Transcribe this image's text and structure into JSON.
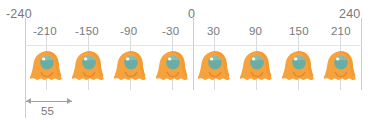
{
  "diagram": {
    "type": "linear-array-layout",
    "title_visible": false,
    "axis": {
      "outer_labels": [
        {
          "text": "-240",
          "value": -240
        },
        {
          "text": "0",
          "value": 0
        },
        {
          "text": "240",
          "value": 240
        }
      ],
      "tick_labels": [
        {
          "text": "-210",
          "value": -210
        },
        {
          "text": "-150",
          "value": -150
        },
        {
          "text": "-90",
          "value": -90
        },
        {
          "text": "-30",
          "value": -30
        },
        {
          "text": "30",
          "value": 30
        },
        {
          "text": "90",
          "value": 90
        },
        {
          "text": "150",
          "value": 150
        },
        {
          "text": "210",
          "value": 210
        }
      ]
    },
    "items": [
      {
        "index": 1,
        "position": -210,
        "icon": "ghost-character-icon"
      },
      {
        "index": 2,
        "position": -150,
        "icon": "ghost-character-icon"
      },
      {
        "index": 3,
        "position": -90,
        "icon": "ghost-character-icon"
      },
      {
        "index": 4,
        "position": -30,
        "icon": "ghost-character-icon"
      },
      {
        "index": 5,
        "position": 30,
        "icon": "ghost-character-icon"
      },
      {
        "index": 6,
        "position": 90,
        "icon": "ghost-character-icon"
      },
      {
        "index": 7,
        "position": 150,
        "icon": "ghost-character-icon"
      },
      {
        "index": 8,
        "position": 210,
        "icon": "ghost-character-icon"
      }
    ],
    "dimension": {
      "label": "55",
      "value": 55,
      "from_value": -240,
      "to_value": -210,
      "description": "spacing dimension"
    },
    "colors": {
      "body": "#f7a33d",
      "body_shade": "#f39a31",
      "head": "#6cada3",
      "head_light": "#8ec3ba",
      "head_ring": "#f7a33d",
      "text": "#77787b",
      "guide_line": "#c9ccd1",
      "grid_line": "#dfe4ea",
      "dimension_line": "#9ea2a8",
      "background": "#ffffff"
    }
  }
}
